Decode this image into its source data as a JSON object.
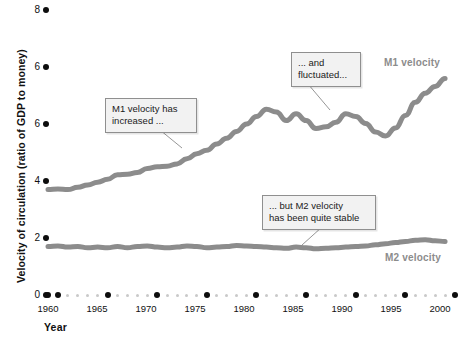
{
  "chart_data": {
    "type": "line",
    "title": "",
    "xlabel": "Year",
    "ylabel": "Velocity of circulation (ratio of GDP to money)",
    "xlim": [
      1959,
      2000
    ],
    "ylim": [
      0,
      10
    ],
    "grid": false,
    "legend_position": "inline-right",
    "xtick_labels": [
      "1960",
      "1965",
      "1970",
      "1975",
      "1980",
      "1985",
      "1990",
      "1995",
      "2000"
    ],
    "xtick_values": [
      1960,
      1965,
      1970,
      1975,
      1980,
      1985,
      1990,
      1995,
      2000
    ],
    "ytick_labels": [
      "8",
      "6",
      "6",
      "4",
      "2",
      "0"
    ],
    "ytick_values": [
      10,
      8,
      6,
      4,
      2,
      0
    ],
    "x": [
      1959,
      1960,
      1961,
      1962,
      1963,
      1964,
      1965,
      1966,
      1967,
      1968,
      1969,
      1970,
      1971,
      1972,
      1973,
      1974,
      1975,
      1976,
      1977,
      1978,
      1979,
      1980,
      1981,
      1982,
      1983,
      1984,
      1985,
      1986,
      1987,
      1988,
      1989,
      1990,
      1991,
      1992,
      1993,
      1994,
      1995,
      1996,
      1997,
      1998,
      1999
    ],
    "series": [
      {
        "name": "M1 velocity",
        "color": "#8c8c8c",
        "values": [
          3.7,
          3.72,
          3.7,
          3.78,
          3.86,
          3.96,
          4.06,
          4.22,
          4.24,
          4.3,
          4.44,
          4.5,
          4.52,
          4.6,
          4.78,
          4.96,
          5.08,
          5.3,
          5.5,
          5.74,
          6.0,
          6.26,
          6.52,
          6.42,
          6.12,
          6.36,
          6.12,
          5.84,
          5.9,
          6.06,
          6.36,
          6.26,
          6.02,
          5.72,
          5.58,
          5.86,
          6.3,
          6.76,
          7.08,
          7.32,
          7.6
        ]
      },
      {
        "name": "M2 velocity",
        "color": "#8c8c8c",
        "values": [
          1.7,
          1.72,
          1.68,
          1.7,
          1.66,
          1.68,
          1.66,
          1.7,
          1.66,
          1.7,
          1.72,
          1.68,
          1.66,
          1.68,
          1.72,
          1.7,
          1.66,
          1.68,
          1.7,
          1.74,
          1.72,
          1.7,
          1.68,
          1.66,
          1.64,
          1.68,
          1.66,
          1.62,
          1.64,
          1.66,
          1.68,
          1.7,
          1.72,
          1.76,
          1.8,
          1.84,
          1.88,
          1.92,
          1.94,
          1.9,
          1.88
        ]
      }
    ],
    "annotations": [
      {
        "id": "m1-increased",
        "text": "M1 velocity has\nincreased ...",
        "anchor_x": 1972.5,
        "anchor_y": 4.9
      },
      {
        "id": "m1-fluctuated",
        "text": "... and\nfluctuated...",
        "anchor_x": 1987.0,
        "anchor_y": 6.1
      },
      {
        "id": "m2-stable",
        "text": "... but M2 velocity\nhas been quite stable",
        "anchor_x": 1989.0,
        "anchor_y": 1.7
      }
    ]
  },
  "axis": {
    "x_title": "Year",
    "y_title": "Velocity of circulation (ratio of GDP to money)",
    "y_ticks": [
      {
        "label": "8",
        "top": 4
      },
      {
        "label": "6",
        "top": 61
      },
      {
        "label": "6",
        "top": 118
      },
      {
        "label": "4",
        "top": 175
      },
      {
        "label": "2",
        "top": 232
      },
      {
        "label": "0",
        "top": 289
      }
    ],
    "x_ticks": [
      {
        "label": "1960",
        "left": 48
      },
      {
        "label": "1965",
        "left": 97
      },
      {
        "label": "1970",
        "left": 146
      },
      {
        "label": "1975",
        "left": 195
      },
      {
        "label": "1980",
        "left": 244
      },
      {
        "label": "1985",
        "left": 293
      },
      {
        "label": "1990",
        "left": 342
      },
      {
        "label": "1995",
        "left": 391
      },
      {
        "label": "2000",
        "left": 440
      }
    ]
  },
  "callouts": [
    {
      "name": "annotation-m1-increased",
      "text": "M1 velocity has\nincreased ...",
      "left": 105,
      "top": 98,
      "width": 78
    },
    {
      "name": "annotation-m1-fluctuated",
      "text": "... and\nfluctuated...",
      "left": 291,
      "top": 52,
      "width": 56
    },
    {
      "name": "annotation-m2-stable",
      "text": "... but M2 velocity\nhas been quite stable",
      "left": 262,
      "top": 195,
      "width": 100
    }
  ],
  "series_labels": [
    {
      "name": "series-label-m1",
      "text": "M1 velocity",
      "left": 384,
      "top": 57
    },
    {
      "name": "series-label-m2",
      "text": "M2 velocity",
      "left": 385,
      "top": 252
    }
  ]
}
